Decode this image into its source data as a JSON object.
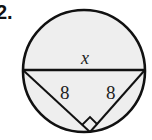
{
  "problem": {
    "number_label": "2."
  },
  "diagram": {
    "shape": "circle with diameter and inscribed right triangle",
    "circle": {
      "cx": 84,
      "cy": 71,
      "r": 61,
      "fill": "#eeeeee",
      "stroke": "#111111"
    },
    "diameter": {
      "x1": 23,
      "y1": 70,
      "x2": 145,
      "y2": 70,
      "label": "x"
    },
    "triangle": {
      "left_vertex": [
        23,
        70
      ],
      "right_vertex": [
        145,
        70
      ],
      "bottom_vertex": [
        90,
        132
      ],
      "left_leg_label": "8",
      "right_leg_label": "8",
      "right_angle_at": "bottom_vertex"
    }
  }
}
